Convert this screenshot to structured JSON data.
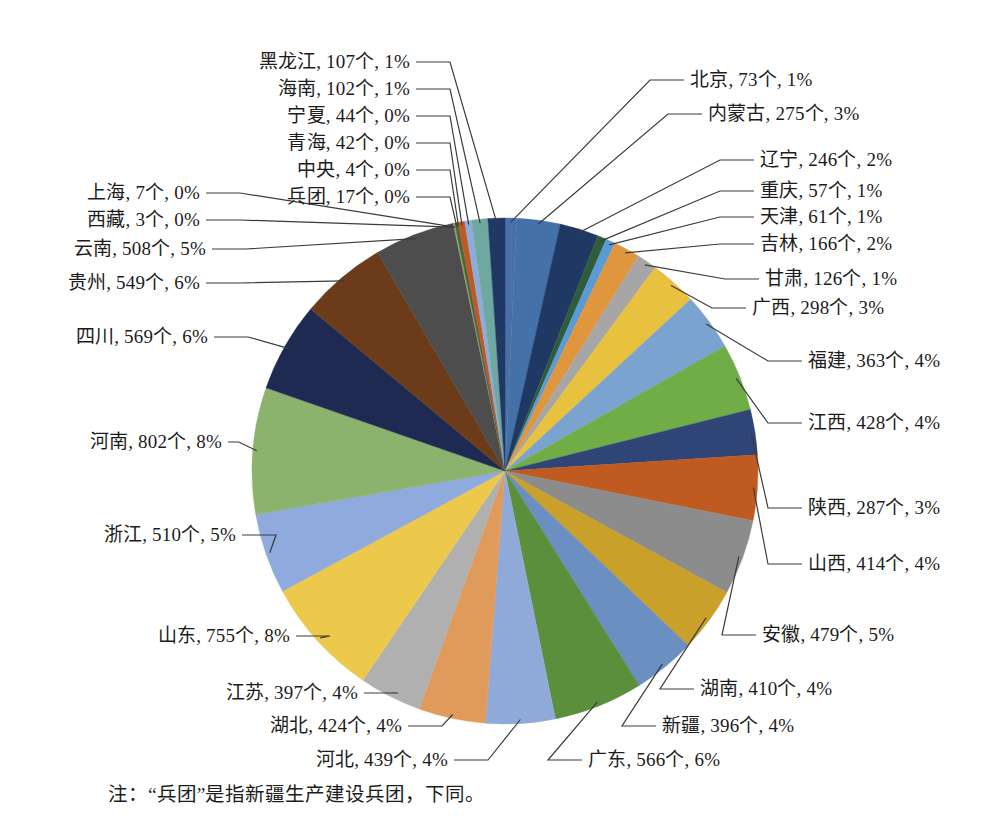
{
  "figure": {
    "note": "注：“兵团”是指新疆生产建设兵团，下同。",
    "unit_suffix": "个",
    "background": "#ffffff"
  },
  "chart_data": {
    "type": "pie",
    "title": "",
    "xlabel": "",
    "ylabel": "",
    "legend_position": "none",
    "label_format": "{name}, {value}个, {percent}%",
    "start_angle_deg": 0,
    "direction": "clockwise",
    "total": 10037,
    "categories": [
      "北京",
      "内蒙古",
      "辽宁",
      "重庆",
      "天津",
      "吉林",
      "甘肃",
      "广西",
      "福建",
      "江西",
      "陕西",
      "山西",
      "安徽",
      "湖南",
      "新疆",
      "广东",
      "河北",
      "湖北",
      "江苏",
      "山东",
      "浙江",
      "河南",
      "四川",
      "贵州",
      "云南",
      "西藏",
      "上海",
      "兵团",
      "中央",
      "青海",
      "宁夏",
      "海南",
      "黑龙江"
    ],
    "values": [
      73,
      275,
      246,
      57,
      61,
      166,
      126,
      298,
      363,
      428,
      287,
      414,
      479,
      410,
      396,
      566,
      439,
      424,
      397,
      755,
      510,
      802,
      569,
      549,
      508,
      3,
      7,
      17,
      4,
      42,
      44,
      102,
      107
    ],
    "percents": [
      1,
      3,
      2,
      1,
      1,
      2,
      1,
      3,
      4,
      4,
      3,
      4,
      5,
      4,
      4,
      6,
      4,
      4,
      4,
      8,
      5,
      8,
      6,
      6,
      5,
      0,
      0,
      0,
      0,
      0,
      0,
      1,
      1
    ],
    "colors": [
      "#4a6fa5",
      "#4472a8",
      "#1f3864",
      "#2e5d3b",
      "#5b9bd5",
      "#e0963c",
      "#a6a6a6",
      "#e8c13f",
      "#7ba3d0",
      "#70ad47",
      "#2f4578",
      "#bf5b21",
      "#8c8c8c",
      "#c8a02a",
      "#6a8fc0",
      "#5b8f3c",
      "#8fa9d8",
      "#e09a5c",
      "#b0b0b0",
      "#ecc94b",
      "#8faadc",
      "#8cb36e",
      "#1f2a52",
      "#6b3b1a",
      "#4d4d4d",
      "#5b9bd5",
      "#c8913a",
      "#3c6e2f",
      "#2f5597",
      "#bf5b21",
      "#8faadc",
      "#6fa8a0",
      "#1f3864"
    ],
    "labels": [
      {
        "name": "北京",
        "value": 73,
        "percent": 1,
        "text": "北京, 73个, 1%"
      },
      {
        "name": "内蒙古",
        "value": 275,
        "percent": 3,
        "text": "内蒙古, 275个, 3%"
      },
      {
        "name": "辽宁",
        "value": 246,
        "percent": 2,
        "text": "辽宁, 246个, 2%"
      },
      {
        "name": "重庆",
        "value": 57,
        "percent": 1,
        "text": "重庆, 57个, 1%"
      },
      {
        "name": "天津",
        "value": 61,
        "percent": 1,
        "text": "天津, 61个, 1%"
      },
      {
        "name": "吉林",
        "value": 166,
        "percent": 2,
        "text": "吉林, 166个, 2%"
      },
      {
        "name": "甘肃",
        "value": 126,
        "percent": 1,
        "text": "甘肃, 126个, 1%"
      },
      {
        "name": "广西",
        "value": 298,
        "percent": 3,
        "text": "广西, 298个, 3%"
      },
      {
        "name": "福建",
        "value": 363,
        "percent": 4,
        "text": "福建, 363个, 4%"
      },
      {
        "name": "江西",
        "value": 428,
        "percent": 4,
        "text": "江西, 428个, 4%"
      },
      {
        "name": "陕西",
        "value": 287,
        "percent": 3,
        "text": "陕西, 287个, 3%"
      },
      {
        "name": "山西",
        "value": 414,
        "percent": 4,
        "text": "山西, 414个, 4%"
      },
      {
        "name": "安徽",
        "value": 479,
        "percent": 5,
        "text": "安徽, 479个, 5%"
      },
      {
        "name": "湖南",
        "value": 410,
        "percent": 4,
        "text": "湖南, 410个, 4%"
      },
      {
        "name": "新疆",
        "value": 396,
        "percent": 4,
        "text": "新疆, 396个, 4%"
      },
      {
        "name": "广东",
        "value": 566,
        "percent": 6,
        "text": "广东, 566个, 6%"
      },
      {
        "name": "河北",
        "value": 439,
        "percent": 4,
        "text": "河北, 439个, 4%"
      },
      {
        "name": "湖北",
        "value": 424,
        "percent": 4,
        "text": "湖北, 424个, 4%"
      },
      {
        "name": "江苏",
        "value": 397,
        "percent": 4,
        "text": "江苏, 397个, 4%"
      },
      {
        "name": "山东",
        "value": 755,
        "percent": 8,
        "text": "山东, 755个, 8%"
      },
      {
        "name": "浙江",
        "value": 510,
        "percent": 5,
        "text": "浙江, 510个, 5%"
      },
      {
        "name": "河南",
        "value": 802,
        "percent": 8,
        "text": "河南, 802个, 8%"
      },
      {
        "name": "四川",
        "value": 569,
        "percent": 6,
        "text": "四川, 569个, 6%"
      },
      {
        "name": "贵州",
        "value": 549,
        "percent": 6,
        "text": "贵州, 549个, 6%"
      },
      {
        "name": "云南",
        "value": 508,
        "percent": 5,
        "text": "云南, 508个, 5%"
      },
      {
        "name": "西藏",
        "value": 3,
        "percent": 0,
        "text": "西藏, 3个, 0%"
      },
      {
        "name": "上海",
        "value": 7,
        "percent": 0,
        "text": "上海, 7个, 0%"
      },
      {
        "name": "兵团",
        "value": 17,
        "percent": 0,
        "text": "兵团, 17个, 0%"
      },
      {
        "name": "中央",
        "value": 4,
        "percent": 0,
        "text": "中央, 4个, 0%"
      },
      {
        "name": "青海",
        "value": 42,
        "percent": 0,
        "text": "青海, 42个, 0%"
      },
      {
        "name": "宁夏",
        "value": 44,
        "percent": 0,
        "text": "宁夏, 44个, 0%"
      },
      {
        "name": "海南",
        "value": 102,
        "percent": 1,
        "text": "海南, 102个, 1%"
      },
      {
        "name": "黑龙江",
        "value": 107,
        "percent": 1,
        "text": "黑龙江, 107个, 1%"
      }
    ]
  },
  "label_layout": [
    {
      "key": "北京",
      "side": "right",
      "x": 690,
      "y": 69,
      "anchorIdx": 0
    },
    {
      "key": "内蒙古",
      "side": "right",
      "x": 708,
      "y": 103,
      "anchorIdx": 1
    },
    {
      "key": "辽宁",
      "side": "right",
      "x": 760,
      "y": 149,
      "anchorIdx": 2
    },
    {
      "key": "重庆",
      "side": "right",
      "x": 760,
      "y": 180,
      "anchorIdx": 3
    },
    {
      "key": "天津",
      "side": "right",
      "x": 760,
      "y": 206,
      "anchorIdx": 4
    },
    {
      "key": "吉林",
      "side": "right",
      "x": 760,
      "y": 233,
      "anchorIdx": 5
    },
    {
      "key": "甘肃",
      "side": "right",
      "x": 765,
      "y": 268,
      "anchorIdx": 6
    },
    {
      "key": "广西",
      "side": "right",
      "x": 752,
      "y": 297,
      "anchorIdx": 7
    },
    {
      "key": "福建",
      "side": "right",
      "x": 808,
      "y": 350,
      "anchorIdx": 8
    },
    {
      "key": "江西",
      "side": "right",
      "x": 808,
      "y": 412,
      "anchorIdx": 9
    },
    {
      "key": "陕西",
      "side": "right",
      "x": 808,
      "y": 497,
      "anchorIdx": 10
    },
    {
      "key": "山西",
      "side": "right",
      "x": 808,
      "y": 553,
      "anchorIdx": 11
    },
    {
      "key": "安徽",
      "side": "right",
      "x": 762,
      "y": 624,
      "anchorIdx": 12
    },
    {
      "key": "湖南",
      "side": "right",
      "x": 700,
      "y": 678,
      "anchorIdx": 13
    },
    {
      "key": "新疆",
      "side": "right",
      "x": 662,
      "y": 715,
      "anchorIdx": 14
    },
    {
      "key": "广东",
      "side": "right",
      "x": 588,
      "y": 749,
      "anchorIdx": 15
    },
    {
      "key": "河北",
      "side": "left",
      "x": 448,
      "y": 749,
      "anchorIdx": 16
    },
    {
      "key": "湖北",
      "side": "left",
      "x": 402,
      "y": 715,
      "anchorIdx": 17
    },
    {
      "key": "江苏",
      "side": "left",
      "x": 358,
      "y": 682,
      "anchorIdx": 18
    },
    {
      "key": "山东",
      "side": "left",
      "x": 290,
      "y": 625,
      "anchorIdx": 19
    },
    {
      "key": "浙江",
      "side": "left",
      "x": 236,
      "y": 524,
      "anchorIdx": 20
    },
    {
      "key": "河南",
      "side": "left",
      "x": 222,
      "y": 431,
      "anchorIdx": 21
    },
    {
      "key": "四川",
      "side": "left",
      "x": 208,
      "y": 326,
      "anchorIdx": 22
    },
    {
      "key": "贵州",
      "side": "left",
      "x": 200,
      "y": 272,
      "anchorIdx": 23
    },
    {
      "key": "云南",
      "side": "left",
      "x": 206,
      "y": 238,
      "anchorIdx": 24
    },
    {
      "key": "西藏",
      "side": "left",
      "x": 200,
      "y": 209,
      "anchorIdx": 25
    },
    {
      "key": "上海",
      "side": "left",
      "x": 200,
      "y": 182,
      "anchorIdx": 26
    },
    {
      "key": "兵团",
      "side": "left",
      "x": 410,
      "y": 186,
      "anchorIdx": 27
    },
    {
      "key": "中央",
      "side": "left",
      "x": 410,
      "y": 159,
      "anchorIdx": 28
    },
    {
      "key": "青海",
      "side": "left",
      "x": 410,
      "y": 132,
      "anchorIdx": 29
    },
    {
      "key": "宁夏",
      "side": "left",
      "x": 410,
      "y": 105,
      "anchorIdx": 30
    },
    {
      "key": "海南",
      "side": "left",
      "x": 410,
      "y": 78,
      "anchorIdx": 31
    },
    {
      "key": "黑龙江",
      "side": "left",
      "x": 410,
      "y": 51,
      "anchorIdx": 32
    }
  ]
}
